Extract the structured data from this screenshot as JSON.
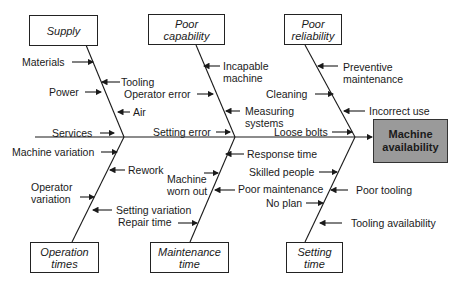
{
  "effect": {
    "line1": "Machine",
    "line2": "availability"
  },
  "categories": {
    "supply": {
      "line1": "Supply"
    },
    "poor_capability": {
      "line1": "Poor",
      "line2": "capability"
    },
    "poor_reliability": {
      "line1": "Poor",
      "line2": "reliability"
    },
    "operation_times": {
      "line1": "Operation",
      "line2": "times"
    },
    "maintenance_time": {
      "line1": "Maintenance",
      "line2": "time"
    },
    "setting_time": {
      "line1": "Setting",
      "line2": "time"
    }
  },
  "causes": {
    "supply": [
      "Materials",
      "Tooling",
      "Power",
      "Air",
      "Services"
    ],
    "poor_capability": [
      "Incapable",
      "machine",
      "Operator error",
      "Measuring",
      "systems",
      "Setting error"
    ],
    "poor_reliability": [
      "Preventive",
      "maintenance",
      "Cleaning",
      "Incorrect use",
      "Loose bolts"
    ],
    "operation_times": [
      "Machine variation",
      "Rework",
      "Operator",
      "variation",
      "Setting variation",
      "Repair time"
    ],
    "maintenance_time": [
      "Response time",
      "Machine",
      "worn out",
      "Poor maintenance",
      "No plan"
    ],
    "setting_time": [
      "Skilled people",
      "Poor tooling",
      "Tooling availability"
    ]
  }
}
